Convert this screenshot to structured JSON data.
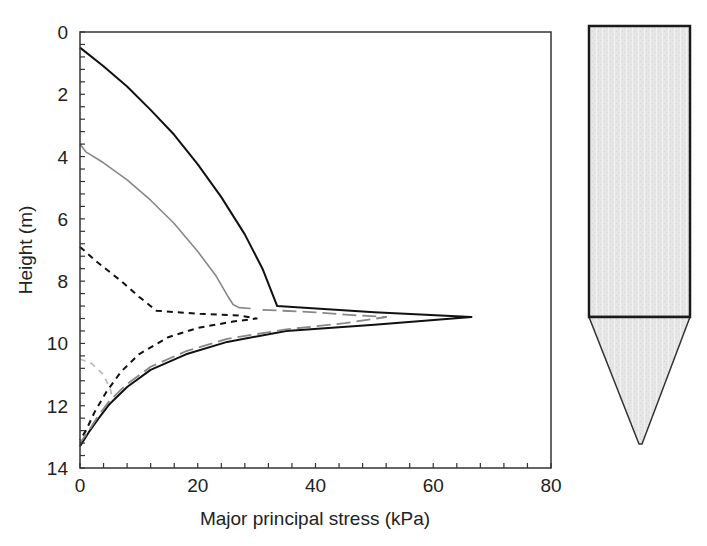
{
  "chart_data": {
    "type": "line",
    "title": "",
    "xlabel": "Major principal stress (kPa)",
    "ylabel": "Height (m)",
    "xlim": [
      0,
      80
    ],
    "ylim": [
      14,
      0
    ],
    "y_inverted": true,
    "grid": false,
    "legend": null,
    "x_ticks": [
      0,
      20,
      40,
      60,
      80
    ],
    "y_ticks": [
      0,
      2,
      4,
      6,
      8,
      10,
      12,
      14
    ],
    "x_minor_step": 4,
    "y_minor_step": 0.4,
    "series": [
      {
        "name": "solid-black",
        "style": "solid",
        "color": "#111111",
        "width": 2,
        "points": [
          [
            0,
            0.5
          ],
          [
            4,
            1.1
          ],
          [
            8,
            1.75
          ],
          [
            12,
            2.5
          ],
          [
            16,
            3.3
          ],
          [
            20,
            4.25
          ],
          [
            24,
            5.3
          ],
          [
            28,
            6.5
          ],
          [
            31,
            7.6
          ],
          [
            33.5,
            8.8
          ],
          [
            50,
            9.0
          ],
          [
            66.5,
            9.15
          ],
          [
            50,
            9.4
          ],
          [
            35,
            9.6
          ],
          [
            25,
            9.95
          ],
          [
            18,
            10.35
          ],
          [
            12,
            10.85
          ],
          [
            8,
            11.4
          ],
          [
            5,
            11.95
          ],
          [
            3,
            12.45
          ],
          [
            1.5,
            12.85
          ],
          [
            0,
            13.3
          ]
        ]
      },
      {
        "name": "solid-gray",
        "style": "solid",
        "color": "#888888",
        "width": 1.6,
        "points": [
          [
            0,
            3.6
          ],
          [
            1,
            3.85
          ],
          [
            4,
            4.2
          ],
          [
            8,
            4.75
          ],
          [
            12,
            5.4
          ],
          [
            16,
            6.15
          ],
          [
            20,
            7.05
          ],
          [
            23,
            7.8
          ],
          [
            25,
            8.45
          ],
          [
            26,
            8.75
          ],
          [
            27,
            8.85
          ],
          [
            29,
            8.88
          ]
        ]
      },
      {
        "name": "long-dash-gray",
        "style": "dashed-long",
        "color": "#888888",
        "width": 1.8,
        "points": [
          [
            31,
            8.92
          ],
          [
            40,
            9.0
          ],
          [
            47,
            9.1
          ],
          [
            52,
            9.15
          ],
          [
            45,
            9.35
          ],
          [
            35,
            9.55
          ],
          [
            25,
            9.85
          ],
          [
            18,
            10.25
          ],
          [
            12,
            10.75
          ],
          [
            8,
            11.3
          ],
          [
            5,
            11.85
          ],
          [
            3,
            12.35
          ],
          [
            1.5,
            12.8
          ],
          [
            0,
            13.2
          ]
        ]
      },
      {
        "name": "short-dash-black",
        "style": "dashed-short",
        "color": "#111111",
        "width": 2,
        "points": [
          [
            0,
            6.9
          ],
          [
            3,
            7.4
          ],
          [
            7,
            8.0
          ],
          [
            10,
            8.5
          ],
          [
            13,
            8.95
          ],
          [
            20,
            9.05
          ],
          [
            27,
            9.1
          ],
          [
            30,
            9.2
          ],
          [
            26,
            9.3
          ],
          [
            20,
            9.5
          ],
          [
            15,
            9.8
          ],
          [
            10,
            10.35
          ],
          [
            7,
            10.9
          ],
          [
            4.5,
            11.55
          ],
          [
            2.5,
            12.2
          ],
          [
            1,
            12.8
          ],
          [
            0,
            13.1
          ]
        ]
      },
      {
        "name": "short-dash-light-gray",
        "style": "dashed-short",
        "color": "#bbbbbb",
        "width": 1.8,
        "points": [
          [
            0,
            10.5
          ],
          [
            2,
            10.65
          ],
          [
            4,
            11.0
          ],
          [
            5.2,
            11.5
          ],
          [
            5.5,
            11.8
          ]
        ]
      }
    ],
    "annotation": {
      "name": "silo-schematic",
      "description": "Silo cross-section: rectangular bin (0 to ~9.1 m) over conical hopper tapering to outlet near 13.3 m"
    }
  },
  "labels": {
    "x_axis_title": "Major principal stress (kPa)",
    "y_axis_title": "Height (m)",
    "x_tick_labels": [
      "0",
      "20",
      "40",
      "60",
      "80"
    ],
    "y_tick_labels": [
      "0",
      "2",
      "4",
      "6",
      "8",
      "10",
      "12",
      "14"
    ]
  }
}
